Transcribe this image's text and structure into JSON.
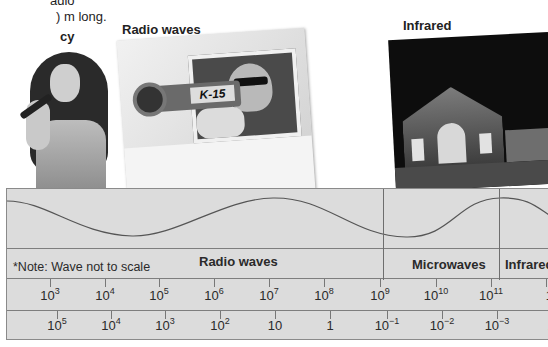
{
  "intro_text": {
    "line1": "adio",
    "line2": ") m long.",
    "bold_lines": [
      "cy",
      "t",
      "as"
    ]
  },
  "photos": [
    {
      "caption": "",
      "subject": "singer-with-microphone"
    },
    {
      "caption": "Radio waves",
      "subject": "police-radar-gun",
      "gun_label": "K-15"
    },
    {
      "caption": "Infrared",
      "subject": "infrared-building"
    }
  ],
  "spectrum": {
    "note": "*Note: Wave not to scale",
    "bands": [
      {
        "label": "Radio waves"
      },
      {
        "label": "Microwaves"
      },
      {
        "label": "Infrared"
      }
    ],
    "frequency_row": [
      {
        "base": "10",
        "exp": "3"
      },
      {
        "base": "10",
        "exp": "4"
      },
      {
        "base": "10",
        "exp": "5"
      },
      {
        "base": "10",
        "exp": "6"
      },
      {
        "base": "10",
        "exp": "7"
      },
      {
        "base": "10",
        "exp": "8"
      },
      {
        "base": "10",
        "exp": "9"
      },
      {
        "base": "10",
        "exp": "10"
      },
      {
        "base": "10",
        "exp": "11"
      },
      {
        "base": "10",
        "exp": ""
      }
    ],
    "wavelength_row": [
      {
        "base": "10",
        "exp": "5"
      },
      {
        "base": "10",
        "exp": "4"
      },
      {
        "base": "10",
        "exp": "3"
      },
      {
        "base": "10",
        "exp": "2"
      },
      {
        "base": "10",
        "exp": ""
      },
      {
        "base": "1",
        "exp": ""
      },
      {
        "base": "10",
        "exp": "−1"
      },
      {
        "base": "10",
        "exp": "−2"
      },
      {
        "base": "10",
        "exp": "−3"
      },
      {
        "base": "1",
        "exp": ""
      }
    ]
  }
}
